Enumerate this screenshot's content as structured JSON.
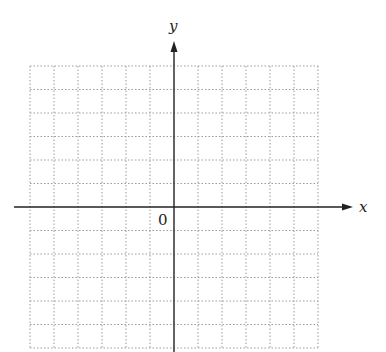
{
  "diagram": {
    "type": "coordinate-plane",
    "axes": {
      "x_label": "x",
      "y_label": "y",
      "origin_label": "0",
      "x_arrow": true,
      "y_arrow": true
    },
    "grid": {
      "style": "dotted",
      "columns_left": 6,
      "columns_right": 6,
      "rows_above": 6,
      "rows_below": 6,
      "line_color": "#9a9a9a",
      "axis_color": "#222222"
    }
  }
}
